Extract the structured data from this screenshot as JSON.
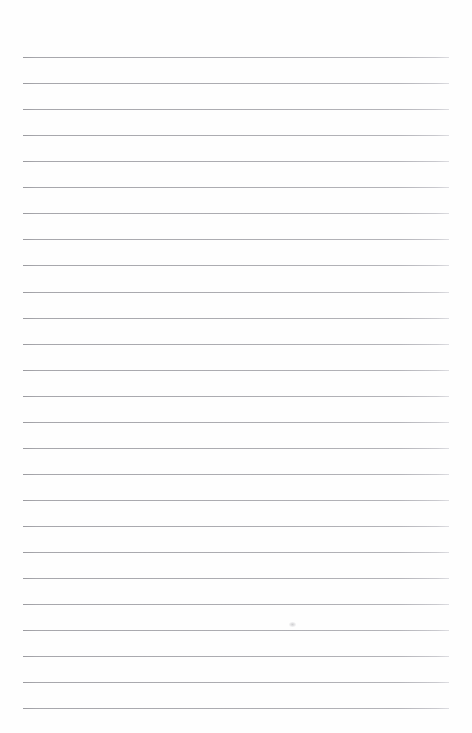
{
  "page": {
    "kind": "lined-notebook-page",
    "width": 472,
    "height": 733,
    "background_color": "#fefefe",
    "text_content": ""
  },
  "ruling": {
    "line_color": "#a9a9ad",
    "line_thickness": 1,
    "line_count": 26,
    "line_spacing": 26.05,
    "first_line_y": 57,
    "last_line_y": 708,
    "line_start_x": 23,
    "line_end_x": 449,
    "line_length": 426,
    "lines_y": [
      57,
      83,
      109,
      135,
      161,
      187,
      213,
      239,
      265,
      292,
      318,
      344,
      370,
      396,
      422,
      448,
      474,
      500,
      526,
      552,
      578,
      604,
      630,
      656,
      682,
      708
    ]
  },
  "margins": {
    "top_margin_height": 57,
    "bottom_margin_height": 25,
    "left_margin_width": 23,
    "right_margin_width": 23
  },
  "marks": [
    {
      "name": "smudge",
      "x": 289,
      "y": 622,
      "width": 7,
      "height": 5
    }
  ]
}
